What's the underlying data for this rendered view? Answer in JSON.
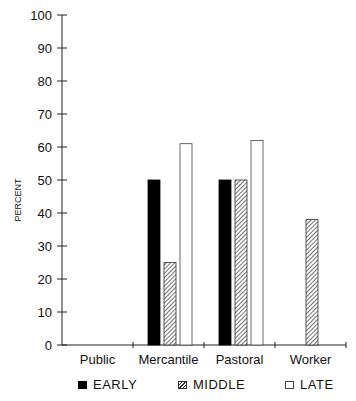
{
  "chart_data": {
    "type": "bar",
    "title": "",
    "xlabel": "",
    "ylabel": "PERCENT",
    "ylim": [
      0,
      100
    ],
    "yticks": [
      0,
      10,
      20,
      30,
      40,
      50,
      60,
      70,
      80,
      90,
      100
    ],
    "categories": [
      "Public",
      "Mercantile",
      "Pastoral",
      "Worker"
    ],
    "series": [
      {
        "name": "EARLY",
        "fill": "solid-black",
        "values": [
          0,
          50,
          50,
          0
        ]
      },
      {
        "name": "MIDDLE",
        "fill": "hatched",
        "values": [
          0,
          25,
          50,
          38
        ]
      },
      {
        "name": "LATE",
        "fill": "white-outline",
        "values": [
          0,
          61,
          62,
          0
        ]
      }
    ],
    "grid": false,
    "legend_position": "bottom"
  },
  "legend": {
    "early": "EARLY",
    "middle": "MIDDLE",
    "late": "LATE"
  },
  "colors": {
    "early": "#000000",
    "middle_hatch": "#333333",
    "late": "#ffffff",
    "axis": "#222222"
  }
}
